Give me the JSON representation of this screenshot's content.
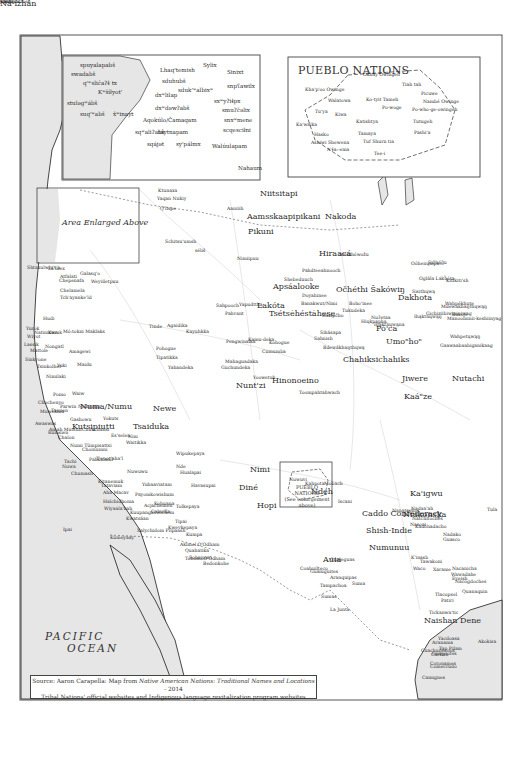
{
  "map": {
    "ocean_label_line1": "PACIFIC",
    "ocean_label_line2": "OCEAN",
    "area_enlarged_label": "Area Enlarged Above",
    "pueblo_inset_title": "PUEBLO NATIONS",
    "pueblo_small_box_line1": "PUEBLO NATIONS",
    "pueblo_small_box_line2": "(See enlargement above)",
    "source_prefix": "Source: Aaron Carapella: Map from ",
    "source_book": "Native American Nations: Traditional Names and Locations",
    "source_suffix": " - 2014",
    "source_line2": "Tribal Nations' official websites and Indigenous language revitalization program websites",
    "colors": {
      "land": "#ffffff",
      "water": "#e6e6e6",
      "coast": "#1a1a1a",
      "border": "#c8c8c8",
      "frame": "#555555"
    }
  },
  "nw_inset": {
    "labels": [
      "spuyalapabš",
      "swadabš",
      "q'ʷslic̓aʔɬ tx",
      "Kʷšíłyot'",
      "stulǝgʷábš",
      "suq'ʷabš",
      "x̌ʷinayt",
      "Lhaq'temish",
      "sduhubš",
      "sduk'ʷalbixʷ",
      "dxʷlilap",
      "dxʷdǝwʔabš",
      "Aqokúlo/Čamaqam",
      "sqʷaliʔabš",
      "táytnapam",
      "sqájǝt",
      "sy'pálmx",
      "Walúulapam",
      "Sylix",
      "Sinixt",
      "snpʕawilx",
      "sxʷyʔiɬpx",
      "smuʔčǝlix",
      "snxʷmene",
      "scqesciłni",
      "Nahaum"
    ]
  },
  "pueblo_inset": {
    "labels": [
      "Okhay Owingeh",
      "Tiah tah",
      "Kha'p'oo Owinge",
      "Picuwe",
      "Walatowa",
      "Ko-tyit Tameh",
      "Nambé Owinge",
      "Po-woge",
      "Po-who-ge-owingeh",
      "Tu'ya",
      "Kiwa",
      "Ka'waika",
      "Katishtya",
      "Tamaya",
      "Tutugeh",
      "Pashi'a",
      "Hasko",
      "Ashiwi Shewena",
      "Tuf Shurn tia",
      "A'ɬa:-ema",
      "Tee-i"
    ]
  },
  "labels": {
    "large": [
      "Niitsitapi",
      "Aamsskaapipikani",
      "Nakoda",
      "Pikuni",
      "Hiraacá",
      "Apsáalooke",
      "Lakóta",
      "Očhéthi Šakówiŋ",
      "Dakhota",
      "Tsétsėhéstȧhese",
      "Pó'ca",
      "Umoⁿhoⁿ",
      "Chahiksichahiks",
      "Jiwere",
      "Kaáⁿze",
      "Nutachi",
      "Hinonoeino",
      "Nunt'zi",
      "Numa/Numu",
      "Newe",
      "Tsaiduka",
      "Kutsipiutti",
      "Nimi",
      "Diné",
      "Hopi",
      "Nde̱h",
      "Ka'igwu",
      "Niukonska",
      "Caddo Confederacy",
      "Shish-Indie",
      "Numunuu",
      "Naishan Dene",
      "Auia",
      "Ná-ízhán"
    ],
    "small": [
      "Ktunaxa",
      "Yaqan Nukiy",
      "Q'lispe",
      "Aaniiih",
      "Schitsu'umsh",
      "séliš",
      "Nimiipuu",
      "Shtaxulwhi't'a",
      "La'mex",
      "Atfalati",
      "Galasq'o",
      "Weyiiletpuu",
      "Chepenafa",
      "Chelamela",
      "Tch'ayanke'ld",
      "Hudi",
      "Yurok",
      "Wiyot",
      "Natinixwe",
      "Karuk",
      "Mó:tokni Maklaks",
      "Lassik",
      "Nongatl",
      "Amagewi",
      "Mattole",
      "Sinkyone",
      "Tsinkolhet",
      "Yuki",
      "Maidu",
      "Nimilaki",
      "Pomo",
      "Waiw",
      "Parwin",
      "Nishinam",
      "Chochenyo",
      "Muwekma",
      "Tamien",
      "Gashowu",
      "Yokuts",
      "Awaswas",
      "Amah Mutsun",
      "Chukchansi",
      "Rumsien",
      "Chalon",
      "Es'selen",
      "Nim",
      "Waitikka",
      "Numi Tümpisattsi",
      "Choinumni",
      "Pahka'anil",
      "Tachi",
      "T'epot'aha'l",
      "Nuwa",
      "Nuwuwu",
      "Chumash",
      "Kitanemuk",
      "Tataviam",
      "Yuhaaviatam",
      "Aha Macav",
      "Payomkowishum",
      "Halchidhoma",
      "Acjachemen",
      "Kohuana",
      "Tolkepaya",
      "Wiyaala'bah",
      "Kuupangaxwichem",
      "Cahuilla",
      "Kwatsáan",
      "Ipai",
      "Kumeyaay",
      "Tipai",
      "Kwevkepaya",
      "Xalychidom Piipaash",
      "Kumpa",
      "Akimel O'Odham",
      "Quahatika",
      "Tohono O'Odham",
      "Sobaipuri",
      "Bedonkohe",
      "Nde",
      "Hualapai",
      "Havasupai",
      "Wipukepaya",
      "Nuwuvi",
      "Kahpota",
      "Mobach",
      "Tinde",
      "Agaidika",
      "Pohogue",
      "Tipatikka",
      "Yahandeka",
      "Kayuhkka",
      "Mahaguadaka",
      "Pengwinaika",
      "Kamu-deka",
      "Kohogue",
      "Guchundeka",
      "Cumumba",
      "Yoowetuh",
      "Toompahtahwach",
      "Yapudttka",
      "Sahpooch",
      "Pahvant",
      "Shebeduuch",
      "Pahdteeahnooch",
      "Doyahinee",
      "Banakwut/Nimi",
      "Boho'inee",
      "Tukudeka",
      "Nuʔetaa",
      "Hiųkpapha",
      "Ihąkthųwąna",
      "Itázipčho",
      "Sihásapa",
      "Sahnish",
      "Bdewákhaŋthųwą",
      "Mnikhówožu",
      "Oóhenųmpa",
      "Sičhą́ǧu",
      "Oglála Lakȟóta",
      "Sisithųwą",
      "Mdewakhaŋthųwąŋ",
      "Gichiziibiwininiwag",
      "Manoominii-keshiinyag",
      "Wahpékhute",
      "Wahpetųwąŋ",
      "Ihąkthųwąŋ",
      "Baxoje",
      "Gaawaabaabiganikaag",
      "Kitikiti'sh",
      "Iscani",
      "Nanatsoho",
      "Nadaa'ah",
      "Natchitoches",
      "Nasoni",
      "Kadohadacho",
      "Nadako",
      "Guasco",
      "Tula",
      "K'inasb",
      "Waco",
      "Tawakoni",
      "Xarame",
      "Nacanicha",
      "Wawadahe",
      "Eyeish",
      "Nacogdoches",
      "Quanaquin",
      "Tlacopsel",
      "Patiri",
      "Tickanwa'tic",
      "Akokisa",
      "Yacdoasa",
      "Aranama",
      "Tap Pilam",
      "Carrizo",
      "Guajolotes",
      "Cotonames",
      "Comecrudo",
      "Cuachuilecoos",
      "Camignes",
      "Gualeguas",
      "Coahuilteco",
      "Guaiuguites",
      "Aranquipas",
      "Tampachoa",
      "Suma",
      "Sumas",
      "La Junta",
      "Jumanos",
      "Tapaxcolmeh",
      "Chizo"
    ]
  }
}
